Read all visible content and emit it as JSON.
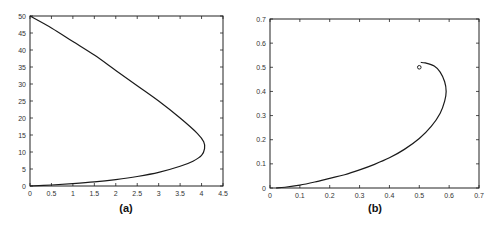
{
  "chart_data": [
    {
      "panel": "(a)",
      "type": "line",
      "title": "",
      "xlabel": "",
      "ylabel": "",
      "xlim": [
        0,
        4.5
      ],
      "ylim": [
        0,
        50
      ],
      "xticks": [
        "0",
        "0.5",
        "1",
        "1.5",
        "2",
        "2.5",
        "3",
        "3.5",
        "4",
        "4.5"
      ],
      "yticks": [
        "0",
        "5",
        "10",
        "15",
        "20",
        "25",
        "30",
        "35",
        "40",
        "45",
        "50"
      ],
      "grid": false,
      "legend": null,
      "series": [
        {
          "name": "curve",
          "x": [
            0,
            0.5,
            1.0,
            1.5,
            2.0,
            2.5,
            3.0,
            3.5,
            3.8,
            4.0,
            4.07,
            4.05,
            3.9,
            3.5,
            3.0,
            2.5,
            2.0,
            1.5,
            1.0,
            0.5,
            0
          ],
          "y": [
            0,
            0.3,
            0.7,
            1.2,
            1.9,
            2.8,
            4.0,
            5.8,
            7.3,
            9.0,
            11.0,
            13.0,
            15.5,
            20.0,
            25.0,
            29.5,
            34.0,
            38.5,
            42.5,
            46.5,
            50
          ]
        }
      ]
    },
    {
      "panel": "(b)",
      "type": "line",
      "title": "",
      "xlabel": "",
      "ylabel": "",
      "xlim": [
        0,
        0.7
      ],
      "ylim": [
        0,
        0.7
      ],
      "xticks": [
        "0",
        "0.1",
        "0.2",
        "0.3",
        "0.4",
        "0.5",
        "0.6",
        "0.7"
      ],
      "yticks": [
        "0",
        "0.1",
        "0.2",
        "0.3",
        "0.4",
        "0.5",
        "0.6",
        "0.7"
      ],
      "grid": false,
      "legend": null,
      "series": [
        {
          "name": "trajectory",
          "x": [
            0.02,
            0.05,
            0.1,
            0.15,
            0.2,
            0.25,
            0.3,
            0.35,
            0.4,
            0.45,
            0.5,
            0.54,
            0.57,
            0.585,
            0.59,
            0.585,
            0.57,
            0.55,
            0.52,
            0.505
          ],
          "y": [
            0.0,
            0.003,
            0.012,
            0.025,
            0.04,
            0.055,
            0.075,
            0.098,
            0.125,
            0.16,
            0.205,
            0.255,
            0.31,
            0.36,
            0.4,
            0.44,
            0.48,
            0.505,
            0.518,
            0.52
          ]
        },
        {
          "name": "start-point",
          "type": "scatter",
          "x": [
            0.5
          ],
          "y": [
            0.5
          ]
        }
      ]
    }
  ],
  "labels": {
    "panel_a": "(a)",
    "panel_b": "(b)"
  }
}
